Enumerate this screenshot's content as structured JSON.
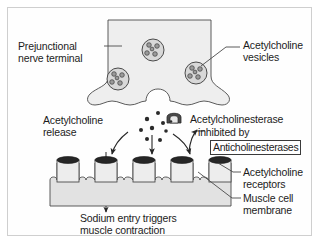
{
  "figure": {
    "border_color": "#cfcfcf",
    "background": "#ffffff"
  },
  "labels": {
    "prejunctional_nerve_terminal": "Prejunctional\nnerve terminal",
    "acetylcholine_vesicles": "Acetylcholine\nvesicles",
    "acetylcholine_release": "Acetylcholine\nrelease",
    "acetylcholinesterase": "Acetylcholinesterase",
    "inhibited_by": "inhibited by",
    "anticholinesterases": "Anticholinesterases",
    "acetylcholine_receptors": "Acetylcholine\nreceptors",
    "muscle_cell_membrane": "Muscle cell\nmembrane",
    "sodium_entry": "Sodium entry triggers\nmuscle contraction"
  },
  "colors": {
    "ink": "#1c1c1c",
    "outline": "#4a4a4a",
    "nerve_terminal_fill": "#eeeeee",
    "membrane_fill": "#e2e2e2",
    "receptor_cap": "#262626",
    "vesicle_fill": "#d8d8d8",
    "enzyme_icon": "#3d3d3d",
    "boxed_border": "#3a3a3a"
  },
  "graphics": {
    "nerve_terminal": {
      "name": "prejunctional-nerve-terminal-shape",
      "vesicle_count": 3,
      "vesicles": [
        {
          "cx": 153,
          "cy": 50,
          "r": 11
        },
        {
          "cx": 118,
          "cy": 79,
          "r": 11
        },
        {
          "cx": 196,
          "cy": 73,
          "r": 11
        }
      ],
      "vesicle_inner_dots": 5
    },
    "acetylcholine_molecules": {
      "name": "acetylcholine-molecule-dots",
      "count": 8,
      "dots": [
        {
          "cx": 158,
          "cy": 113,
          "r": 2.0
        },
        {
          "cx": 147,
          "cy": 119,
          "r": 2.2
        },
        {
          "cx": 163,
          "cy": 123,
          "r": 2.0
        },
        {
          "cx": 152,
          "cy": 128,
          "r": 2.2
        },
        {
          "cx": 141,
          "cy": 130,
          "r": 2.0
        },
        {
          "cx": 166,
          "cy": 131,
          "r": 1.8
        },
        {
          "cx": 147,
          "cy": 139,
          "r": 2.0
        },
        {
          "cx": 160,
          "cy": 140,
          "r": 2.0
        }
      ]
    },
    "receptors": {
      "name": "acetylcholine-receptor-channels",
      "count": 5,
      "x_positions": [
        68,
        106,
        144,
        182,
        220
      ],
      "top_y": 158,
      "height": 26,
      "width": 22
    },
    "muscle_membrane": {
      "name": "muscle-cell-membrane-band",
      "x": 50,
      "y": 176,
      "width": 192,
      "height": 30
    },
    "arrows": {
      "count": 4,
      "items": [
        {
          "name": "ach-to-receptor-left-arrow",
          "type": "curved"
        },
        {
          "name": "ach-to-receptor-center-arrow",
          "type": "straight"
        },
        {
          "name": "ach-to-enzyme-arrow",
          "type": "curved"
        },
        {
          "name": "sodium-entry-arrow",
          "type": "straight-long"
        }
      ]
    },
    "enzyme_icon": {
      "name": "acetylcholinesterase-icon",
      "x": 167,
      "y": 112,
      "width": 14,
      "height": 11
    }
  }
}
